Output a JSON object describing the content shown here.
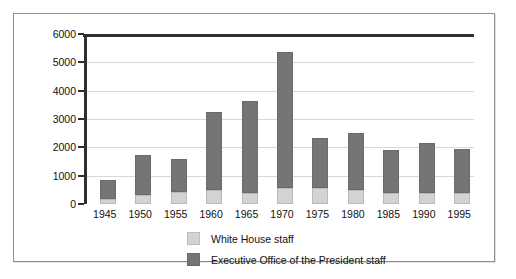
{
  "chart_data": {
    "type": "bar",
    "stacked": true,
    "title": "",
    "xlabel": "",
    "ylabel": "",
    "ylim": [
      0,
      6000
    ],
    "ytick_step": 1000,
    "grid": true,
    "legend_position": "bottom",
    "categories": [
      "1945",
      "1950",
      "1955",
      "1960",
      "1965",
      "1970",
      "1975",
      "1980",
      "1985",
      "1990",
      "1995"
    ],
    "ytick_labels": [
      "6000",
      "5000",
      "4000",
      "3000",
      "2000",
      "1000",
      "0"
    ],
    "series": [
      {
        "name": "White House staff",
        "color": "#d3d3d3",
        "values": [
          180,
          310,
          430,
          480,
          400,
          580,
          560,
          490,
          380,
          400,
          400
        ]
      },
      {
        "name": "Executive Office of the President staff",
        "color": "#757575",
        "values": [
          680,
          1420,
          1170,
          2760,
          3240,
          4770,
          1770,
          2010,
          1520,
          1750,
          1530
        ]
      }
    ],
    "totals": [
      860,
      1730,
      1600,
      3240,
      3640,
      5350,
      2330,
      2500,
      1900,
      2150,
      1930
    ]
  }
}
